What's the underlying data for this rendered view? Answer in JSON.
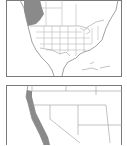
{
  "figure": {
    "panels": [
      {
        "id": "north-america",
        "description": "Range map of North America",
        "range_region": "Pacific Northwest coast (British Columbia / Washington / Oregon)",
        "range_color": "#8a8a8a"
      },
      {
        "id": "western-us-detail",
        "description": "Detail map of western United States",
        "range_region": "Pacific coast strip (Oregon / northern California)",
        "range_color": "#8a8a8a"
      }
    ],
    "colors": {
      "background": "#ffffff",
      "border": "#7a7a7a",
      "boundary": "#9a9a9a",
      "range_fill": "#8a8a8a"
    }
  }
}
